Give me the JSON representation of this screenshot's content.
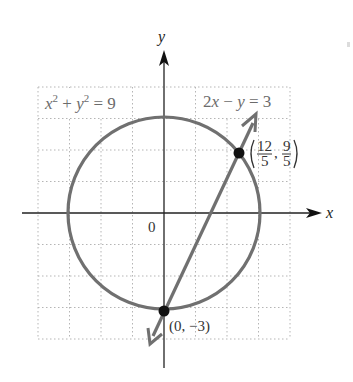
{
  "figure": {
    "axes": {
      "x_label": "x",
      "y_label": "y",
      "origin_label": "0",
      "grid_range": {
        "x": [
          -4,
          4
        ],
        "y": [
          -4,
          4
        ]
      },
      "grid_step": 1,
      "grid_style": "dotted"
    },
    "curves": [
      {
        "name": "circle",
        "equation_text": {
          "a": "x",
          "sup1": "2",
          "plus": " + ",
          "b": "y",
          "sup2": "2",
          "rhs": " = 9"
        },
        "center": [
          0,
          0
        ],
        "radius": 3,
        "color": "#707070"
      },
      {
        "name": "line",
        "equation_text": {
          "a": "2",
          "b": "x",
          "minus": " − ",
          "c": "y",
          "rhs": " = 3"
        },
        "slope": 2,
        "intercept": -3,
        "color": "#707070"
      }
    ],
    "points": [
      {
        "name": "intersection-upper",
        "x": 2.4,
        "y": 1.8,
        "label_num_x": "12",
        "label_den_x": "5",
        "label_num_y": "9",
        "label_den_y": "5"
      },
      {
        "name": "intersection-lower",
        "x": 0,
        "y": -3,
        "label": "(0, −3)"
      }
    ],
    "colors": {
      "axis": "#222222",
      "curve": "#707070",
      "grid": "#b5b5b5",
      "point": "#111111"
    }
  }
}
